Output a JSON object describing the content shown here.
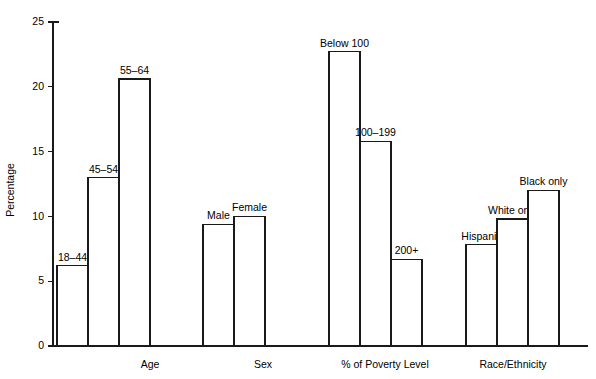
{
  "chart_data": {
    "type": "bar",
    "title": "",
    "subtitle": "",
    "xlabel": "",
    "ylabel": "Percentage",
    "ylim": [
      0,
      25
    ],
    "yticks": [
      0,
      5,
      10,
      15,
      20,
      25
    ],
    "ytick_labels": [
      "0",
      "5",
      "10",
      "15",
      "20",
      "25"
    ],
    "grid": false,
    "legend": "none",
    "bar_value_labels": true,
    "groups": [
      {
        "name": "Age",
        "categories": [
          "18–44",
          "45–54",
          "55–64"
        ],
        "values": [
          6.2,
          13.0,
          20.6
        ]
      },
      {
        "name": "Sex",
        "categories": [
          "Male",
          "Female"
        ],
        "values": [
          9.4,
          10.0
        ]
      },
      {
        "name": "% of Poverty Level",
        "categories": [
          "Below 100",
          "100–199",
          "200+"
        ],
        "values": [
          22.7,
          15.8,
          6.7
        ]
      },
      {
        "name": "Race/Ethnicity",
        "categories": [
          "Hispanic",
          "White only",
          "Black only"
        ],
        "values": [
          7.8,
          9.8,
          12.0
        ]
      }
    ],
    "colors": {
      "bar_fill": "#ffffff",
      "bar_stroke": "#1a1a1a",
      "axis": "#1a1a1a",
      "text": "#000000",
      "background": "#ffffff"
    }
  }
}
